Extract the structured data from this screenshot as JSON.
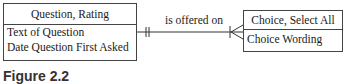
{
  "entities": {
    "left": {
      "name": "Question, Rating",
      "attributes": [
        "Text of Question",
        "Date Question First Asked"
      ]
    },
    "right": {
      "name": "Choice, Select All",
      "attributes": [
        "Choice Wording"
      ]
    }
  },
  "relationship": {
    "label": "is offered on",
    "left_cardinality": "one-and-only-one",
    "right_cardinality": "one-or-many"
  },
  "caption": "Figure 2.2"
}
